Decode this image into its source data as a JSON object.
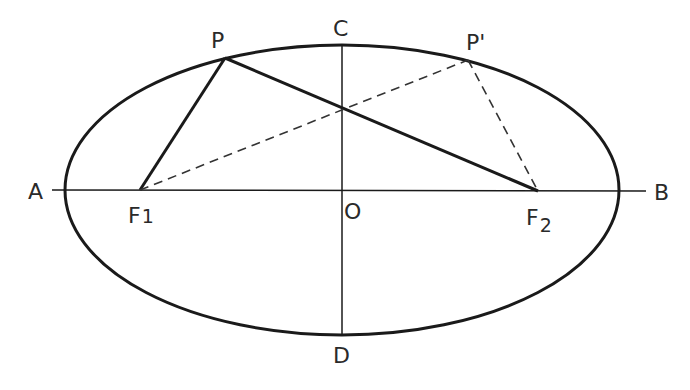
{
  "diagram": {
    "type": "ellipse-foci-geometry",
    "ellipse": {
      "cx": 342,
      "cy": 190,
      "rx": 277,
      "ry": 145
    },
    "colors": {
      "stroke": "#1a1a1a",
      "text": "#2a2a2a",
      "background": "#ffffff"
    },
    "points": {
      "A": {
        "label": "A",
        "x": 50,
        "y": 190
      },
      "B": {
        "label": "B",
        "x": 648,
        "y": 190
      },
      "C": {
        "label": "C",
        "x": 342,
        "y": 44
      },
      "D": {
        "label": "D",
        "x": 342,
        "y": 334
      },
      "O": {
        "label": "O",
        "x": 342,
        "y": 190
      },
      "P": {
        "label": "P",
        "x": 225,
        "y": 58
      },
      "P_prime": {
        "label": "P'",
        "x": 468,
        "y": 60
      },
      "F1": {
        "label": "F",
        "subscript": "1",
        "x": 140,
        "y": 190
      },
      "F2": {
        "label": "F",
        "subscript": "2",
        "x": 538,
        "y": 191
      }
    },
    "segments": [
      {
        "from": "A",
        "to": "B",
        "style": "thin-solid",
        "name": "major-axis"
      },
      {
        "from": "C",
        "to": "D",
        "style": "thin-solid",
        "name": "minor-axis"
      },
      {
        "from": "F1",
        "to": "P",
        "style": "thick-solid",
        "name": "segment-f1-p"
      },
      {
        "from": "P",
        "to": "F2",
        "style": "thick-solid",
        "name": "segment-p-f2"
      },
      {
        "from": "F1",
        "to": "P_prime",
        "style": "dashed",
        "name": "segment-f1-pprime"
      },
      {
        "from": "P_prime",
        "to": "F2",
        "style": "dashed",
        "name": "segment-pprime-f2"
      }
    ]
  }
}
